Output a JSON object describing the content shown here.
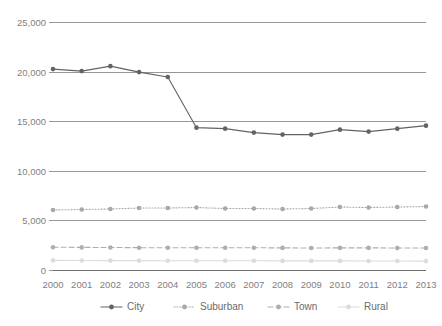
{
  "chart_data": {
    "type": "line",
    "title": "",
    "subtitle": "",
    "xlabel": "",
    "ylabel": "",
    "categories": [
      "2000",
      "2001",
      "2002",
      "2003",
      "2004",
      "2005",
      "2006",
      "2007",
      "2008",
      "2009",
      "2010",
      "2011",
      "2012",
      "2013"
    ],
    "x": [
      2000,
      2001,
      2002,
      2003,
      2004,
      2005,
      2006,
      2007,
      2008,
      2009,
      2010,
      2011,
      2012,
      2013
    ],
    "ylim": [
      0,
      25000
    ],
    "ytick_values": [
      0,
      5000,
      10000,
      15000,
      20000,
      25000
    ],
    "ytick_labels": [
      "0",
      "5,000",
      "10,000",
      "15,000",
      "20,000",
      "25,000"
    ],
    "grid": true,
    "legend_position": "bottom",
    "series": [
      {
        "name": "City",
        "style": "solid",
        "color": "#636363",
        "values": [
          20300,
          20100,
          20600,
          20000,
          19500,
          14400,
          14300,
          13900,
          13700,
          13700,
          14200,
          14000,
          14300,
          14600
        ]
      },
      {
        "name": "Suburban",
        "style": "dotted",
        "color": "#a8a8a8",
        "values": [
          6100,
          6150,
          6200,
          6300,
          6300,
          6350,
          6250,
          6250,
          6200,
          6250,
          6400,
          6350,
          6400,
          6450
        ]
      },
      {
        "name": "Town",
        "style": "dashed",
        "color": "#aeaeae",
        "values": [
          2350,
          2330,
          2320,
          2300,
          2300,
          2300,
          2300,
          2290,
          2280,
          2270,
          2280,
          2280,
          2270,
          2270
        ]
      },
      {
        "name": "Rural",
        "style": "solid-light",
        "color": "#dcdcdc",
        "values": [
          1020,
          1010,
          1000,
          1000,
          990,
          990,
          980,
          980,
          970,
          970,
          970,
          960,
          960,
          950
        ]
      }
    ]
  },
  "legend": {
    "items": [
      {
        "label": "City",
        "color": "#636363",
        "style": "solid"
      },
      {
        "label": "Suburban",
        "color": "#a8a8a8",
        "style": "dotted"
      },
      {
        "label": "Town",
        "color": "#aeaeae",
        "style": "dashed"
      },
      {
        "label": "Rural",
        "color": "#dcdcdc",
        "style": "solid-light"
      }
    ]
  },
  "colors": {
    "background": "#ffffff",
    "gridline": "#8c8c8c",
    "axis": "#6e6e6e",
    "tick_text": "#7f7f7f"
  }
}
